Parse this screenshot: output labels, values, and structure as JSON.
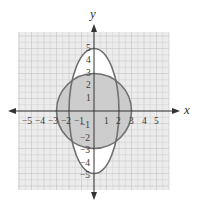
{
  "diagram": {
    "type": "graph-of-conics",
    "axes": {
      "x_label": "x",
      "y_label": "y",
      "x_ticks": [
        "−5",
        "−4",
        "−3",
        "−2",
        "−1",
        "1",
        "2",
        "3",
        "4",
        "5"
      ],
      "y_ticks": [
        "5",
        "4",
        "3",
        "2",
        "1",
        "−1",
        "−2",
        "−3",
        "−4",
        "−5"
      ],
      "grid_range": [
        -6,
        6
      ]
    },
    "shapes": [
      {
        "name": "circle",
        "center": [
          0,
          0
        ],
        "radius": 3,
        "fill": "#c9c9c9",
        "stroke": "#707070"
      },
      {
        "name": "ellipse",
        "center": [
          0,
          0
        ],
        "rx": 2,
        "ry": 5,
        "fill": "#ffffff",
        "stroke": "#707070"
      }
    ],
    "colors": {
      "grid_bg": "#ececec",
      "grid_line": "#c8c8c8",
      "axis": "#333333",
      "circle_fill": "#c9c9c9",
      "shape_stroke": "#707070"
    }
  }
}
